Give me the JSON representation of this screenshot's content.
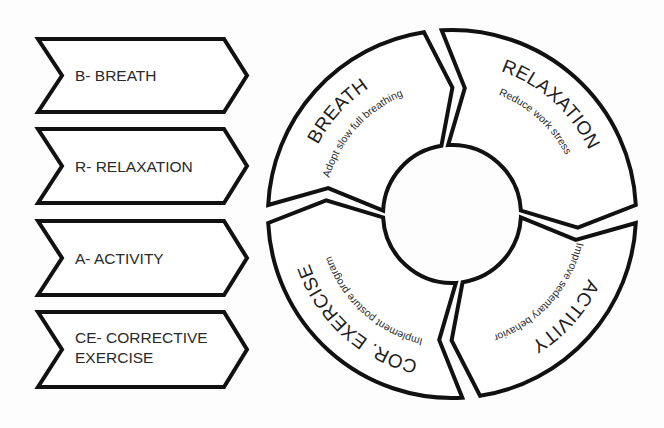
{
  "colors": {
    "stroke": "#111111",
    "fill": "#ffffff",
    "text": "#222222",
    "background": "#fdfdfd"
  },
  "legend": [
    {
      "lines": [
        "B- BREATH"
      ]
    },
    {
      "lines": [
        "R- RELAXATION"
      ]
    },
    {
      "lines": [
        "A- ACTIVITY"
      ]
    },
    {
      "lines": [
        "CE- CORRECTIVE",
        "EXERCISE"
      ]
    }
  ],
  "cycle": {
    "segments": [
      {
        "title": "BREATH",
        "subtitle": "Adopt slow full breathing"
      },
      {
        "title": "RELAXATION",
        "subtitle": "Reduce work stress"
      },
      {
        "title": "ACTIVITY",
        "subtitle": "Improve sedentary behavior"
      },
      {
        "title": "COR. EXERCISE",
        "subtitle": "Implement posture program"
      }
    ]
  }
}
